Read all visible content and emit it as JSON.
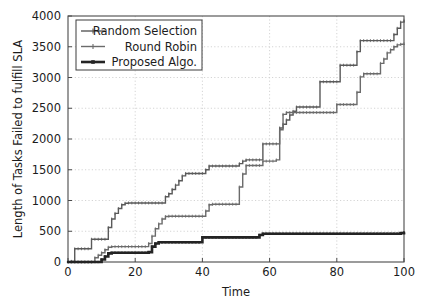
{
  "chart_data": {
    "type": "line",
    "title": "",
    "xlabel": "Time",
    "ylabel": "Length of Tasks Failed to fulfill SLA",
    "xlim": [
      0,
      100
    ],
    "ylim": [
      0,
      4000
    ],
    "xticks": [
      0,
      20,
      40,
      60,
      80,
      100
    ],
    "yticks": [
      0,
      500,
      1000,
      1500,
      2000,
      2500,
      3000,
      3500,
      4000
    ],
    "xtick_labels": [
      "0",
      "20",
      "40",
      "60",
      "80",
      "100"
    ],
    "ytick_labels": [
      "0",
      "500",
      "1000",
      "1500",
      "2000",
      "2500",
      "3000",
      "3500",
      "4000"
    ],
    "grid": true,
    "grid_style": "dotted",
    "grid_color": "#cfcfcf",
    "legend_position": "top-left",
    "drawstyle": "steps-post",
    "series": [
      {
        "name": "Random Selection",
        "color": "#5a5a5a",
        "marker": "plus",
        "linewidth": 1.4,
        "x": [
          0,
          1,
          2,
          6,
          7,
          11,
          12,
          13,
          14,
          15,
          16,
          17,
          18,
          19,
          20,
          28,
          29,
          30,
          31,
          32,
          33,
          34,
          35,
          36,
          37,
          38,
          39,
          40,
          41,
          42,
          50,
          51,
          52,
          53,
          54,
          57,
          58,
          62,
          63,
          64,
          65,
          66,
          67,
          68,
          74,
          75,
          80,
          81,
          85,
          86,
          87,
          88,
          96,
          97,
          98,
          99,
          100
        ],
        "y": [
          0,
          10,
          215,
          215,
          370,
          370,
          560,
          700,
          790,
          870,
          930,
          955,
          960,
          960,
          960,
          960,
          1060,
          1110,
          1180,
          1250,
          1320,
          1400,
          1440,
          1440,
          1440,
          1440,
          1440,
          1440,
          1500,
          1560,
          1560,
          1600,
          1640,
          1660,
          1660,
          1660,
          1920,
          1920,
          2180,
          2240,
          2310,
          2390,
          2450,
          2520,
          2520,
          2930,
          2930,
          3200,
          3200,
          3420,
          3600,
          3600,
          3600,
          3700,
          3800,
          3900,
          3930
        ]
      },
      {
        "name": "Round Robin",
        "color": "#6b6b6b",
        "marker": "plus",
        "linewidth": 1.4,
        "x": [
          0,
          7,
          8,
          9,
          10,
          11,
          12,
          13,
          20,
          24,
          25,
          26,
          27,
          28,
          29,
          30,
          39,
          40,
          41,
          42,
          43,
          50,
          51,
          52,
          53,
          54,
          55,
          56,
          57,
          58,
          62,
          63,
          64,
          65,
          66,
          67,
          68,
          74,
          75,
          80,
          85,
          86,
          87,
          88,
          92,
          93,
          94,
          95,
          96,
          97,
          98,
          99,
          100
        ],
        "y": [
          0,
          0,
          70,
          110,
          150,
          200,
          240,
          250,
          250,
          300,
          420,
          540,
          620,
          700,
          740,
          745,
          745,
          745,
          830,
          930,
          940,
          940,
          1220,
          1430,
          1570,
          1570,
          1570,
          1570,
          1570,
          1640,
          1660,
          2150,
          2400,
          2430,
          2430,
          2430,
          2430,
          2430,
          2430,
          2560,
          2560,
          2760,
          3010,
          3060,
          3060,
          3230,
          3300,
          3400,
          3450,
          3500,
          3530,
          3540,
          3550
        ]
      },
      {
        "name": "Proposed Algo.",
        "color": "#242424",
        "marker": "square",
        "linewidth": 2.6,
        "x": [
          0,
          9,
          10,
          11,
          12,
          13,
          20,
          24,
          25,
          26,
          27,
          39,
          40,
          56,
          57,
          58,
          99,
          100
        ],
        "y": [
          0,
          0,
          40,
          90,
          140,
          150,
          150,
          160,
          250,
          300,
          320,
          320,
          400,
          400,
          440,
          460,
          470,
          480
        ]
      }
    ]
  },
  "legend": {
    "items": [
      {
        "label": "Random Selection"
      },
      {
        "label": "Round Robin"
      },
      {
        "label": "Proposed Algo."
      }
    ]
  }
}
